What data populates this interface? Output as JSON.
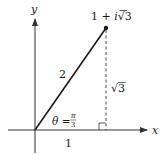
{
  "diagram": {
    "type": "complex-plane-polar",
    "axes": {
      "x_label": "x",
      "y_label": "y"
    },
    "point": {
      "label_prefix": "1 + ",
      "label_i": "i",
      "label_sqrt": "√",
      "label_radicand": "3",
      "real": 1,
      "imag": "√3"
    },
    "labels": {
      "hypotenuse": "2",
      "vertical_leg_sqrt": "√",
      "vertical_leg_radicand": "3",
      "horizontal_leg": "1",
      "angle_theta": "θ",
      "angle_eq": " = ",
      "angle_num": "π",
      "angle_den": "3"
    },
    "colors": {
      "ink": "#1a1a1a",
      "axis": "#333333",
      "background": "#ffffff"
    }
  }
}
